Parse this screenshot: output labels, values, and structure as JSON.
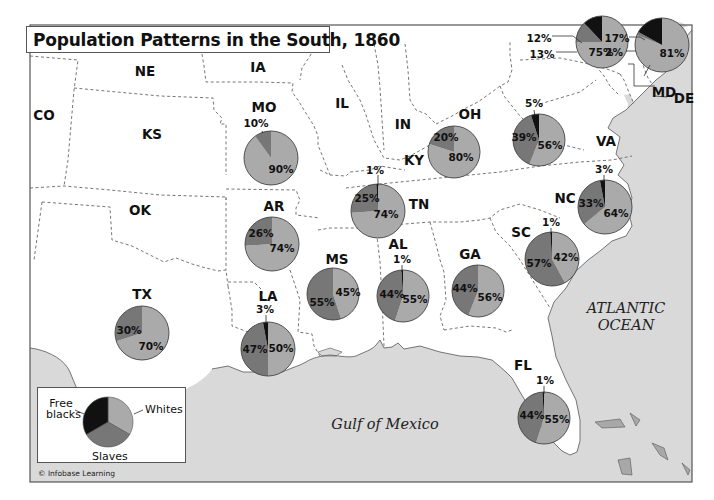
{
  "title": "Population Patterns in the South, 1860",
  "credit": "© Infobase Learning",
  "colors": {
    "land": "#ffffff",
    "water": "#d9d9d9",
    "whites": "#aaaaaa",
    "slaves": "#777777",
    "free_blacks": "#111111",
    "border": "#555555"
  },
  "water_labels": {
    "gulf": "Gulf of Mexico",
    "atlantic_line1": "ATLANTIC",
    "atlantic_line2": "OCEAN"
  },
  "legend": {
    "free_blacks": "Free",
    "free_blacks_2": "blacks",
    "whites": "Whites",
    "slaves": "Slaves"
  },
  "state_labels": [
    {
      "abbr": "NE",
      "x": 145,
      "y": 71
    },
    {
      "abbr": "IA",
      "x": 258,
      "y": 67
    },
    {
      "abbr": "CO",
      "x": 44,
      "y": 115
    },
    {
      "abbr": "KS",
      "x": 152,
      "y": 134
    },
    {
      "abbr": "MO",
      "x": 264,
      "y": 107
    },
    {
      "abbr": "IL",
      "x": 342,
      "y": 103
    },
    {
      "abbr": "IN",
      "x": 403,
      "y": 124
    },
    {
      "abbr": "OH",
      "x": 470,
      "y": 114
    },
    {
      "abbr": "OK",
      "x": 140,
      "y": 210
    },
    {
      "abbr": "KY",
      "x": 414,
      "y": 160
    },
    {
      "abbr": "TN",
      "x": 419,
      "y": 204
    },
    {
      "abbr": "AR",
      "x": 274,
      "y": 206
    },
    {
      "abbr": "NC",
      "x": 565,
      "y": 198
    },
    {
      "abbr": "SC",
      "x": 521,
      "y": 232
    },
    {
      "abbr": "MS",
      "x": 337,
      "y": 259
    },
    {
      "abbr": "AL",
      "x": 398,
      "y": 244
    },
    {
      "abbr": "GA",
      "x": 470,
      "y": 254
    },
    {
      "abbr": "TX",
      "x": 142,
      "y": 294
    },
    {
      "abbr": "LA",
      "x": 268,
      "y": 296
    },
    {
      "abbr": "FL",
      "x": 523,
      "y": 365
    },
    {
      "abbr": "VA",
      "x": 606,
      "y": 141
    },
    {
      "abbr": "MD",
      "x": 664,
      "y": 92
    },
    {
      "abbr": "DE",
      "x": 684,
      "y": 98
    }
  ],
  "chart_data": {
    "type": "pie",
    "title": "Population Patterns in the South, 1860",
    "legend": [
      "Whites",
      "Slaves",
      "Free blacks"
    ],
    "units": "percent of state population",
    "series": [
      {
        "state": "MO",
        "whites": 90,
        "slaves": 10,
        "free_blacks": 0,
        "labels": [
          "10%",
          "90%"
        ]
      },
      {
        "state": "KY",
        "whites": 80,
        "slaves": 20,
        "free_blacks": 0,
        "labels": [
          "20%",
          "80%"
        ]
      },
      {
        "state": "VA",
        "whites": 56,
        "slaves": 39,
        "free_blacks": 5,
        "labels": [
          "5%",
          "39%",
          "56%"
        ]
      },
      {
        "state": "MD",
        "whites": 75,
        "slaves": 13,
        "free_blacks": 12,
        "labels": [
          "12%",
          "13%",
          "75%"
        ]
      },
      {
        "state": "DE",
        "whites": 81,
        "slaves": 2,
        "free_blacks": 17,
        "labels": [
          "17%",
          "2%",
          "81%"
        ]
      },
      {
        "state": "TN",
        "whites": 74,
        "slaves": 25,
        "free_blacks": 1,
        "labels": [
          "1%",
          "25%",
          "74%"
        ]
      },
      {
        "state": "NC",
        "whites": 64,
        "slaves": 33,
        "free_blacks": 3,
        "labels": [
          "3%",
          "33%",
          "64%"
        ]
      },
      {
        "state": "AR",
        "whites": 74,
        "slaves": 26,
        "free_blacks": 0,
        "labels": [
          "26%",
          "74%"
        ]
      },
      {
        "state": "SC",
        "whites": 42,
        "slaves": 57,
        "free_blacks": 1,
        "labels": [
          "1%",
          "57%",
          "42%"
        ]
      },
      {
        "state": "MS",
        "whites": 45,
        "slaves": 55,
        "free_blacks": 0,
        "labels": [
          "55%",
          "45%"
        ]
      },
      {
        "state": "AL",
        "whites": 55,
        "slaves": 44,
        "free_blacks": 1,
        "labels": [
          "1%",
          "44%",
          "55%"
        ]
      },
      {
        "state": "GA",
        "whites": 56,
        "slaves": 44,
        "free_blacks": 0,
        "labels": [
          "44%",
          "56%"
        ]
      },
      {
        "state": "LA",
        "whites": 50,
        "slaves": 47,
        "free_blacks": 3,
        "labels": [
          "3%",
          "47%",
          "50%"
        ]
      },
      {
        "state": "TX",
        "whites": 70,
        "slaves": 30,
        "free_blacks": 0,
        "labels": [
          "30%",
          "70%"
        ]
      },
      {
        "state": "FL",
        "whites": 55,
        "slaves": 44,
        "free_blacks": 1,
        "labels": [
          "1%",
          "44%",
          "55%"
        ]
      }
    ]
  },
  "pies": [
    {
      "state": "MO",
      "cx": 271,
      "cy": 158,
      "r": 27,
      "whites": 90,
      "slaves": 10,
      "free": 0,
      "texts": [
        {
          "t": "10%",
          "x": 256,
          "y": 123
        },
        {
          "t": "90%",
          "x": 281,
          "y": 169
        }
      ],
      "lead": [
        [
          262,
          131
        ],
        [
          263,
          134
        ]
      ]
    },
    {
      "state": "KY",
      "cx": 454,
      "cy": 152,
      "r": 26,
      "whites": 80,
      "slaves": 20,
      "free": 0,
      "texts": [
        {
          "t": "20%",
          "x": 446,
          "y": 137
        },
        {
          "t": "80%",
          "x": 461,
          "y": 157
        }
      ]
    },
    {
      "state": "VA",
      "cx": 539,
      "cy": 140,
      "r": 26,
      "whites": 56,
      "slaves": 39,
      "free": 5,
      "texts": [
        {
          "t": "5%",
          "x": 534,
          "y": 103
        },
        {
          "t": "39%",
          "x": 524,
          "y": 137
        },
        {
          "t": "56%",
          "x": 550,
          "y": 145
        }
      ],
      "lead": [
        [
          534,
          110
        ],
        [
          535,
          115
        ]
      ]
    },
    {
      "state": "MD",
      "cx": 602,
      "cy": 42,
      "r": 26,
      "whites": 75,
      "slaves": 13,
      "free": 12,
      "texts": [
        {
          "t": "12%",
          "x": 539,
          "y": 38
        },
        {
          "t": "13%",
          "x": 542,
          "y": 54
        },
        {
          "t": "75%",
          "x": 601,
          "y": 52
        }
      ]
    },
    {
      "state": "DE",
      "cx": 662,
      "cy": 45,
      "r": 27,
      "whites": 81,
      "slaves": 2,
      "free": 17,
      "texts": [
        {
          "t": "17%",
          "x": 617,
          "y": 38
        },
        {
          "t": "2%",
          "x": 614,
          "y": 52
        },
        {
          "t": "81%",
          "x": 672,
          "y": 53
        }
      ]
    },
    {
      "state": "TN",
      "cx": 378,
      "cy": 211,
      "r": 27,
      "whites": 74,
      "slaves": 25,
      "free": 1,
      "texts": [
        {
          "t": "1%",
          "x": 375,
          "y": 170
        },
        {
          "t": "25%",
          "x": 367,
          "y": 198
        },
        {
          "t": "74%",
          "x": 386,
          "y": 214
        }
      ],
      "lead": [
        [
          378,
          175
        ],
        [
          378,
          184
        ]
      ]
    },
    {
      "state": "NC",
      "cx": 605,
      "cy": 207,
      "r": 27,
      "whites": 64,
      "slaves": 33,
      "free": 3,
      "texts": [
        {
          "t": "3%",
          "x": 604,
          "y": 169
        },
        {
          "t": "33%",
          "x": 591,
          "y": 203
        },
        {
          "t": "64%",
          "x": 616,
          "y": 213
        }
      ],
      "lead": [
        [
          604,
          175
        ],
        [
          604,
          180
        ]
      ]
    },
    {
      "state": "AR",
      "cx": 272,
      "cy": 244,
      "r": 27,
      "whites": 74,
      "slaves": 26,
      "free": 0,
      "texts": [
        {
          "t": "26%",
          "x": 261,
          "y": 233
        },
        {
          "t": "74%",
          "x": 282,
          "y": 248
        }
      ]
    },
    {
      "state": "SC",
      "cx": 552,
      "cy": 259,
      "r": 27,
      "whites": 42,
      "slaves": 57,
      "free": 1,
      "texts": [
        {
          "t": "1%",
          "x": 551,
          "y": 222
        },
        {
          "t": "57%",
          "x": 539,
          "y": 263
        },
        {
          "t": "42%",
          "x": 566,
          "y": 257
        }
      ],
      "lead": [
        [
          551,
          228
        ],
        [
          551,
          232
        ]
      ]
    },
    {
      "state": "MS",
      "cx": 333,
      "cy": 294,
      "r": 26,
      "whites": 45,
      "slaves": 55,
      "free": 0,
      "texts": [
        {
          "t": "55%",
          "x": 322,
          "y": 302
        },
        {
          "t": "45%",
          "x": 348,
          "y": 292
        }
      ]
    },
    {
      "state": "AL",
      "cx": 403,
      "cy": 296,
      "r": 26,
      "whites": 55,
      "slaves": 44,
      "free": 1,
      "texts": [
        {
          "t": "1%",
          "x": 402,
          "y": 259
        },
        {
          "t": "44%",
          "x": 392,
          "y": 294
        },
        {
          "t": "55%",
          "x": 415,
          "y": 299
        }
      ],
      "lead": [
        [
          402,
          265
        ],
        [
          402,
          270
        ]
      ]
    },
    {
      "state": "GA",
      "cx": 478,
      "cy": 291,
      "r": 26,
      "whites": 56,
      "slaves": 44,
      "free": 0,
      "texts": [
        {
          "t": "44%",
          "x": 465,
          "y": 288
        },
        {
          "t": "56%",
          "x": 490,
          "y": 297
        }
      ]
    },
    {
      "state": "LA",
      "cx": 268,
      "cy": 349,
      "r": 27,
      "whites": 50,
      "slaves": 47,
      "free": 3,
      "texts": [
        {
          "t": "3%",
          "x": 265,
          "y": 309
        },
        {
          "t": "47%",
          "x": 255,
          "y": 349
        },
        {
          "t": "50%",
          "x": 281,
          "y": 348
        }
      ],
      "lead": [
        [
          266,
          315
        ],
        [
          266,
          322
        ]
      ]
    },
    {
      "state": "TX",
      "cx": 142,
      "cy": 333,
      "r": 27,
      "whites": 70,
      "slaves": 30,
      "free": 0,
      "texts": [
        {
          "t": "30%",
          "x": 129,
          "y": 330
        },
        {
          "t": "70%",
          "x": 151,
          "y": 346
        }
      ]
    },
    {
      "state": "FL",
      "cx": 544,
      "cy": 418,
      "r": 26,
      "whites": 55,
      "slaves": 44,
      "free": 1,
      "texts": [
        {
          "t": "1%",
          "x": 545,
          "y": 380
        },
        {
          "t": "44%",
          "x": 532,
          "y": 415
        },
        {
          "t": "55%",
          "x": 557,
          "y": 419
        }
      ],
      "lead": [
        [
          544,
          386
        ],
        [
          544,
          392
        ]
      ]
    }
  ]
}
